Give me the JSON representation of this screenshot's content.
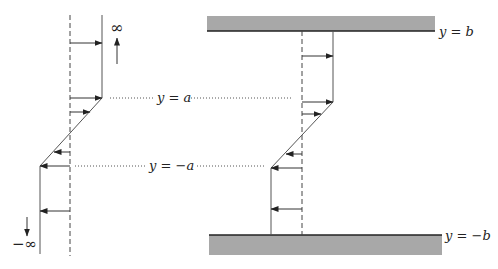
{
  "diagram": {
    "colors": {
      "line": "#444444",
      "wall_fill": "#a8a8a8",
      "wall_edge": "#222222",
      "text": "#222222"
    },
    "left_panel": {
      "top_label": "∞",
      "bottom_label": "−∞",
      "upper_arrow_direction": "up",
      "lower_arrow_direction": "down"
    },
    "right_panel": {
      "top_wall_label": "y = b",
      "bottom_wall_label": "y = −b"
    },
    "levels": {
      "upper": "y = a",
      "lower": "y = −a"
    }
  }
}
